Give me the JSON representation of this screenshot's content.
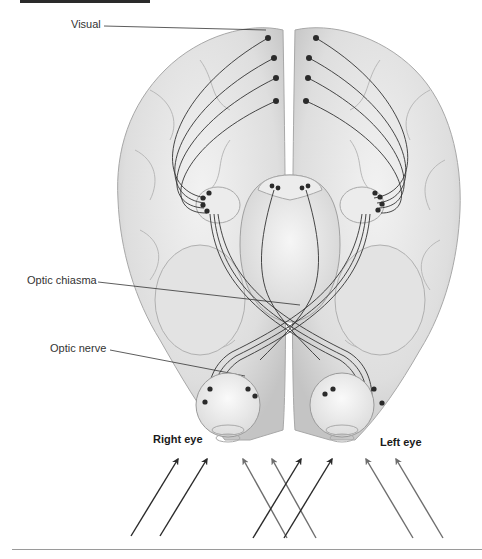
{
  "diagram": {
    "labels": {
      "visual": "Visual",
      "optic_chiasma": "Optic chiasma",
      "optic_nerve": "Optic nerve",
      "right_eye": "Right eye",
      "left_eye": "Left eye"
    },
    "colors": {
      "brain_fill": "#e6e6e6",
      "brain_shade": "#c8c8c8",
      "nerve_line": "#333333",
      "dot": "#2b2b2b",
      "arrow_dark": "#2a2a2a",
      "arrow_gray": "#6e6e6e",
      "label_text": "#333333"
    },
    "arrows": [
      {
        "group": "right-eye",
        "shade": "dark"
      },
      {
        "group": "right-eye",
        "shade": "dark"
      },
      {
        "group": "center",
        "shade": "gray"
      },
      {
        "group": "center",
        "shade": "gray"
      },
      {
        "group": "center",
        "shade": "dark"
      },
      {
        "group": "center",
        "shade": "dark"
      },
      {
        "group": "left-eye",
        "shade": "gray"
      },
      {
        "group": "left-eye",
        "shade": "gray"
      }
    ]
  }
}
